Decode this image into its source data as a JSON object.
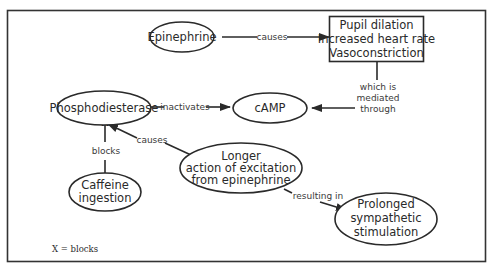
{
  "diagram": {
    "nodes": {
      "epinephrine": {
        "label": "Epinephrine"
      },
      "effects": {
        "lines": [
          "Pupil dilation",
          "Increased heart rate",
          "Vasoconstriction"
        ]
      },
      "phosphodiesterase": {
        "label": "Phosphodiesterase"
      },
      "camp": {
        "label": "cAMP"
      },
      "caffeine": {
        "lines": [
          "Caffeine",
          "ingestion"
        ]
      },
      "longer_action": {
        "lines": [
          "Longer",
          "action of excitation",
          "from epinephrine"
        ]
      },
      "prolonged": {
        "lines": [
          "Prolonged",
          "sympathetic",
          "stimulation"
        ]
      }
    },
    "edges": {
      "epinephrine_effects": {
        "label": "causes"
      },
      "effects_camp": {
        "lines": [
          "which is",
          "mediated",
          "through"
        ]
      },
      "pde_camp": {
        "label": "inactivates"
      },
      "caffeine_pde": {
        "label": "blocks"
      },
      "longer_pde": {
        "label": "causes"
      },
      "longer_prolonged": {
        "label": "resulting in"
      }
    },
    "block_mark": "X",
    "legend": "X = blocks"
  }
}
